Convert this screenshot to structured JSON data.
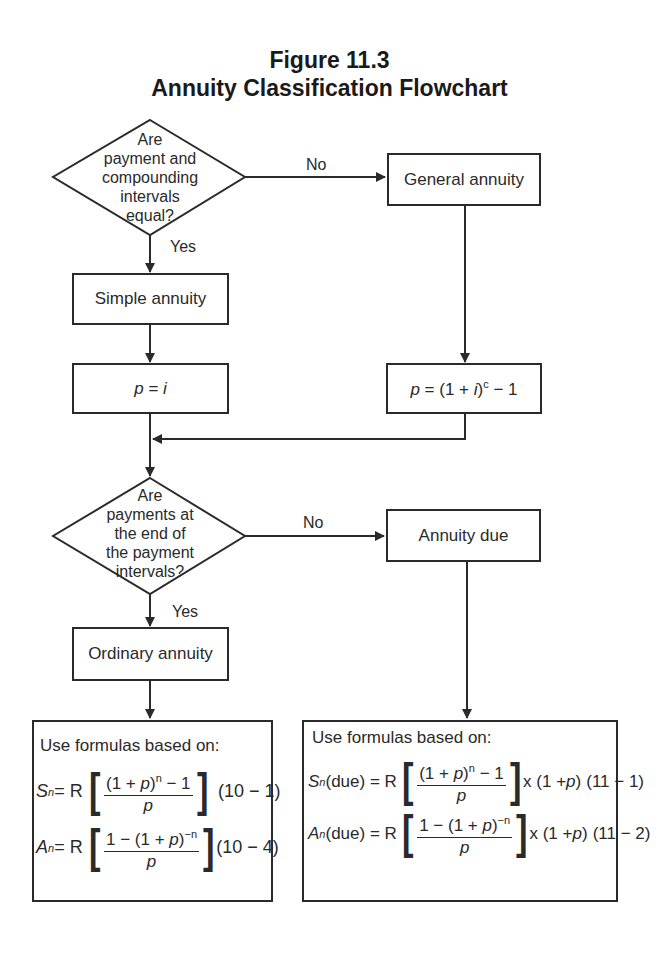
{
  "figure": {
    "number": "Figure 11.3",
    "title": "Annuity Classification Flowchart"
  },
  "decision1": {
    "lines": [
      "Are",
      "payment and",
      "compounding",
      "intervals",
      "equal?"
    ],
    "no_label": "No",
    "yes_label": "Yes"
  },
  "nodes": {
    "general_annuity": "General annuity",
    "simple_annuity": "Simple annuity",
    "p_equals_i": {
      "lhs": "p",
      "eq": " = ",
      "rhs": "i"
    },
    "p_general": {
      "lhs": "p",
      "mid": " = (1 + ",
      "i": "i",
      "close": ")",
      "exp": "c",
      "tail": " − 1"
    },
    "annuity_due": "Annuity due",
    "ordinary_annuity": "Ordinary annuity"
  },
  "decision2": {
    "lines": [
      "Are",
      "payments at",
      "the end of",
      "the payment",
      "intervals?"
    ],
    "no_label": "No",
    "yes_label": "Yes"
  },
  "ordinary_formulas": {
    "heading": "Use formulas based on:",
    "fv": {
      "symbol": "S",
      "sub": "n",
      "eq": " = R",
      "num_pre": "(1 + ",
      "num_p": "p",
      "num_close": ")",
      "num_exp": "n",
      "num_post": " − 1",
      "den": "p",
      "ref": "(10 − 1)"
    },
    "pv": {
      "symbol": "A",
      "sub": "n",
      "eq": " = R",
      "num_pre": "1 − (1 + ",
      "num_p": "p",
      "num_close": ")",
      "num_exp": "−n",
      "num_post": "",
      "den": "p",
      "ref": "(10 − 4)"
    }
  },
  "due_formulas": {
    "heading": "Use formulas based on:",
    "fv": {
      "symbol": "S",
      "sub": "n",
      "eq": "(due) = R",
      "num_pre": "(1 + ",
      "num_p": "p",
      "num_close": ")",
      "num_exp": "n",
      "num_post": " − 1",
      "den": "p",
      "mult": "x (1 + ",
      "mult_p": "p",
      "mult_close": ")",
      "ref": "(11 − 1)"
    },
    "pv": {
      "symbol": "A",
      "sub": "n",
      "eq": "(due) = R",
      "num_pre": "1 − (1 + ",
      "num_p": "p",
      "num_close": ")",
      "num_exp": "−n",
      "num_post": "",
      "den": "p",
      "mult": "x (1 + ",
      "mult_p": "p",
      "mult_close": ")",
      "ref": "(11 − 2)"
    }
  },
  "colors": {
    "line": "#2a2a2a",
    "text": "#1a1a1a",
    "background": "#ffffff"
  }
}
